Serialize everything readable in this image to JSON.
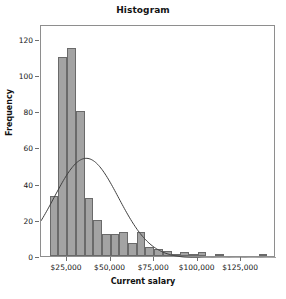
{
  "chart_data": {
    "type": "bar",
    "title": "Histogram",
    "xlabel": "Current salary",
    "ylabel": "Frequency",
    "grid": false,
    "legend": null,
    "ylim": [
      0,
      128
    ],
    "xlim": [
      10000,
      145000
    ],
    "ytick_labels": [
      "0",
      "20",
      "40",
      "60",
      "80",
      "100",
      "120"
    ],
    "ytick_values": [
      0,
      20,
      40,
      60,
      80,
      100,
      120
    ],
    "xtick_labels": [
      "$25,000",
      "$50,000",
      "$75,000",
      "$100,000",
      "$125,000"
    ],
    "xtick_values": [
      25000,
      50000,
      75000,
      100000,
      125000
    ],
    "bin_width": 5000,
    "bin_starts": [
      15000,
      20000,
      25000,
      30000,
      35000,
      40000,
      45000,
      50000,
      55000,
      60000,
      65000,
      70000,
      75000,
      80000,
      85000,
      90000,
      95000,
      100000,
      105000,
      110000,
      115000,
      120000,
      125000,
      130000,
      135000
    ],
    "categories": [
      "15,000",
      "20,000",
      "25,000",
      "30,000",
      "35,000",
      "40,000",
      "45,000",
      "50,000",
      "55,000",
      "60,000",
      "65,000",
      "70,000",
      "75,000",
      "80,000",
      "85,000",
      "90,000",
      "95,000",
      "100,000",
      "105,000",
      "110,000",
      "115,000",
      "120,000",
      "125,000",
      "130,000",
      "135,000"
    ],
    "values": [
      33,
      110,
      115,
      80,
      32,
      20,
      12,
      12,
      13,
      7,
      13,
      5,
      4,
      3,
      1,
      2,
      1,
      2,
      0,
      1,
      0,
      0,
      0,
      0,
      1
    ],
    "bar_color": "#a3a3a3",
    "bar_edge_color": "#6a6a6a",
    "overlay": {
      "name": "normal-curve",
      "type": "line",
      "color": "#404040",
      "peak_value": 55,
      "peak_x": 36000,
      "mean": 36000,
      "std": 18500,
      "start_value": 17,
      "points_x": [
        10000,
        15000,
        20000,
        25000,
        30000,
        35000,
        40000,
        45000,
        50000,
        55000,
        60000,
        65000,
        70000,
        75000,
        80000,
        85000,
        90000,
        95000,
        100000,
        110000,
        120000,
        130000,
        145000
      ],
      "points_y": [
        17,
        27,
        36,
        44,
        51,
        55,
        55,
        52,
        46,
        39,
        31,
        23,
        16,
        11,
        7,
        4,
        2,
        1.2,
        0.6,
        0.2,
        0.05,
        0.01,
        0
      ]
    }
  },
  "figure": {
    "title": "Histogram",
    "x_axis_title": "Current salary",
    "y_axis_title": "Frequency"
  }
}
